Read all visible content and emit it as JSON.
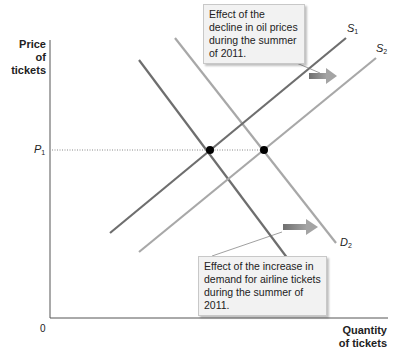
{
  "axes": {
    "y_label_line1": "Price of",
    "y_label_line2": "tickets",
    "x_label_line1": "Quantity",
    "x_label_line2": "of tickets",
    "origin": "0"
  },
  "price_level": {
    "symbol": "P",
    "subscript": "1"
  },
  "curves": {
    "S1": {
      "symbol": "S",
      "subscript": "1"
    },
    "S2": {
      "symbol": "S",
      "subscript": "2"
    },
    "D1": {
      "symbol": "D",
      "subscript": "1"
    },
    "D2": {
      "symbol": "D",
      "subscript": "2"
    }
  },
  "callouts": {
    "supply_shift": "Effect of the decline in oil prices during the summer of 2011.",
    "demand_shift": "Effect of the increase in demand for airline tickets during the summer of 2011."
  },
  "colors": {
    "axis": "#555555",
    "s1_d1": "#6e6e6e",
    "s2_d2": "#a8a8a8",
    "arrow": "#8a8a8a",
    "equilibrium_dot": "#000000"
  }
}
